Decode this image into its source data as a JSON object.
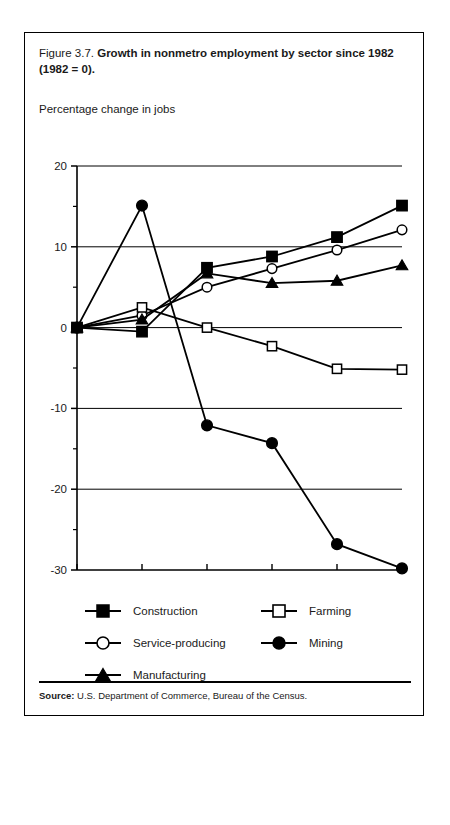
{
  "figure": {
    "label": "Figure 3.7.",
    "title": "Growth in nonmetro employment by sector since 1982 (1982 = 0).",
    "title_line1": "Growth in nonmetro employment by sector since 1982",
    "title_line2": "(1982 = 0).",
    "axis_note": "Percentage change in jobs",
    "source_label": "Source:",
    "source_text": "U.S. Department of Commerce, Bureau of the Census."
  },
  "chart_data": {
    "type": "line",
    "title": "Growth in nonmetro employment by sector since 1982 (1982 = 0)",
    "xlabel": "",
    "ylabel": "Percentage change in jobs",
    "x": [
      "1982",
      "1983",
      "1984",
      "1985",
      "1986",
      "1987"
    ],
    "xlim": [
      "1982",
      "1987"
    ],
    "ylim": [
      -30,
      20
    ],
    "yticks": [
      20,
      10,
      0,
      -10,
      -20,
      -30
    ],
    "ytick_labels": [
      "20",
      "10",
      "0",
      "-10",
      "-20",
      "-30"
    ],
    "yminor_step": 5,
    "grid": "horizontal-major",
    "legend_position": "below-plot",
    "series": [
      {
        "name": "Construction",
        "marker": "filled-square",
        "color": "#000000",
        "values": [
          0,
          -0.5,
          7.4,
          8.8,
          11.2,
          15.1
        ]
      },
      {
        "name": "Service-producing",
        "marker": "open-circle",
        "color": "#000000",
        "values": [
          0,
          1.5,
          5.0,
          7.3,
          9.6,
          12.1
        ]
      },
      {
        "name": "Manufacturing",
        "marker": "filled-triangle",
        "color": "#000000",
        "values": [
          0,
          1.0,
          6.7,
          5.5,
          5.8,
          7.7
        ]
      },
      {
        "name": "Farming",
        "marker": "open-square",
        "color": "#000000",
        "values": [
          0,
          2.5,
          0.0,
          -2.3,
          -5.1,
          -5.2
        ]
      },
      {
        "name": "Mining",
        "marker": "filled-circle",
        "color": "#000000",
        "values": [
          0,
          15.1,
          -12.1,
          -14.3,
          -26.8,
          -29.8
        ]
      }
    ]
  },
  "legend": {
    "items": [
      {
        "label": "Construction",
        "marker": "filled-square"
      },
      {
        "label": "Farming",
        "marker": "open-square"
      },
      {
        "label": "Service-producing",
        "marker": "open-circle"
      },
      {
        "label": "Mining",
        "marker": "filled-circle"
      },
      {
        "label": "Manufacturing",
        "marker": "filled-triangle"
      }
    ]
  }
}
